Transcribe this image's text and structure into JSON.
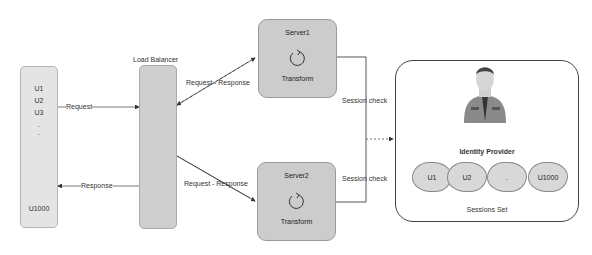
{
  "users_box": {
    "items": [
      "U1",
      "U2",
      "U3",
      ".",
      ".",
      "U1000"
    ]
  },
  "load_balancer": {
    "label": "Load Balancer"
  },
  "arrows": {
    "request": "Request",
    "response": "Response",
    "lb_server1": "Request - Response",
    "lb_server2": "Request - Response",
    "session_check_1": "Session check",
    "session_check_2": "Session check"
  },
  "servers": [
    {
      "title": "Server1",
      "process": "Transform"
    },
    {
      "title": "Server2",
      "process": "Transform"
    }
  ],
  "identity_provider": {
    "label": "Identity Provider",
    "sessions_label": "Sessions Set",
    "sessions": [
      "U1",
      "U2",
      ".",
      "U1000"
    ]
  },
  "colors": {
    "box_fill": "#d9d9d9",
    "server_fill": "#cccccc",
    "line": "#444444"
  }
}
